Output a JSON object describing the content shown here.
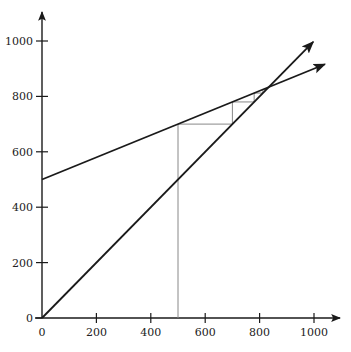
{
  "chart_data": {
    "type": "line",
    "title": "",
    "xlabel": "",
    "ylabel": "",
    "xlim": [
      0,
      1000
    ],
    "ylim": [
      0,
      1000
    ],
    "grid": false,
    "legend": null,
    "x_ticks": [
      0,
      200,
      400,
      600,
      800,
      1000
    ],
    "y_ticks": [
      0,
      200,
      400,
      600,
      800,
      1000
    ],
    "x_tick_labels": [
      "0",
      "200",
      "400",
      "600",
      "800",
      "1000"
    ],
    "y_tick_labels": [
      "0",
      "200",
      "400",
      "600",
      "800",
      "1000"
    ],
    "series": [
      {
        "name": "45-degree line",
        "style": "arrow",
        "x": [
          0,
          997
        ],
        "y": [
          0,
          997
        ]
      },
      {
        "name": "expenditure line",
        "style": "arrow",
        "x": [
          0,
          1040
        ],
        "y": [
          500,
          916
        ]
      }
    ],
    "cobweb": {
      "name": "adjustment path",
      "color": "#888888",
      "points": [
        [
          500,
          0
        ],
        [
          500,
          700
        ],
        [
          700,
          700
        ],
        [
          700,
          780
        ],
        [
          780,
          780
        ],
        [
          780,
          812
        ],
        [
          812,
          812
        ],
        [
          812,
          825
        ],
        [
          825,
          825
        ]
      ]
    },
    "equilibrium": [
      833,
      833
    ]
  },
  "axes": {
    "x_labels": [
      "0",
      "200",
      "400",
      "600",
      "800",
      "1000"
    ],
    "y_labels": [
      "0",
      "200",
      "400",
      "600",
      "800",
      "1000"
    ]
  }
}
